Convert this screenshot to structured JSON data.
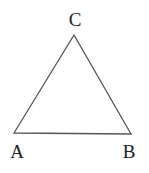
{
  "diagram": {
    "type": "triangle",
    "stroke_color": "#555555",
    "vertices": [
      {
        "id": "A",
        "label": "A",
        "x": 14,
        "y": 133
      },
      {
        "id": "B",
        "label": "B",
        "x": 131,
        "y": 134
      },
      {
        "id": "C",
        "label": "C",
        "x": 74,
        "y": 35
      }
    ],
    "labels": {
      "A": "A",
      "B": "B",
      "C": "C"
    }
  }
}
